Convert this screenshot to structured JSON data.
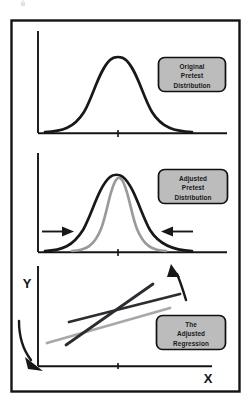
{
  "figure": {
    "background_color": "#ffffff",
    "frame": {
      "name": "outer-border",
      "color": "#141414",
      "x": 11,
      "y": 20,
      "width": 229,
      "height": 372
    },
    "ink_colors": {
      "black": "#17181a",
      "dark_line": "#2b2d31",
      "gray_curve": "#9a9a9a",
      "gray_line": "#a8a8a8",
      "callout_fill": "#bcbcbc",
      "callout_border": "#101010",
      "axis": "#141414"
    }
  },
  "panels": [
    {
      "id": "panel-original",
      "name": "original-pretest-panel",
      "callout": {
        "name": "callout-original-pretest-distribution",
        "lines": [
          "Original",
          "Pretest",
          "Distribution"
        ],
        "fill": "#bcbcbc"
      },
      "axis": {
        "y_axis": true,
        "x_axis": true,
        "center_tick": true
      },
      "curves": [
        {
          "name": "original-distribution-curve",
          "color": "#17181a",
          "width": 2.6,
          "spread": "wide"
        }
      ],
      "arrows": []
    },
    {
      "id": "panel-adjusted",
      "name": "adjusted-pretest-panel",
      "callout": {
        "name": "callout-adjusted-pretest-distribution",
        "lines": [
          "Adjusted",
          "Pretest",
          "Distribution"
        ],
        "fill": "#bcbcbc"
      },
      "axis": {
        "y_axis": true,
        "x_axis": true,
        "center_tick": true
      },
      "curves": [
        {
          "name": "unadjusted-distribution-curve",
          "color": "#17181a",
          "width": 2.6,
          "spread": "wide"
        },
        {
          "name": "adjusted-distribution-curve",
          "color": "#9a9a9a",
          "width": 2.6,
          "spread": "narrow"
        }
      ],
      "arrows": [
        {
          "name": "left-shrink-arrow",
          "direction": "right",
          "color": "#17181a"
        },
        {
          "name": "right-shrink-arrow",
          "direction": "left",
          "color": "#17181a"
        }
      ]
    },
    {
      "id": "panel-regression",
      "name": "adjusted-regression-panel",
      "callout": {
        "name": "callout-the-adjusted-regression",
        "lines": [
          "The",
          "Adjusted",
          "Regression"
        ],
        "fill": "#bcbcbc"
      },
      "axis": {
        "y_axis": true,
        "x_axis": true,
        "center_tick": true,
        "y_label": "Y",
        "x_label": "X"
      },
      "lines": [
        {
          "name": "shallow-regression-line",
          "color": "#2b2d31",
          "width": 2.6,
          "slope": "shallow"
        },
        {
          "name": "steep-regression-line",
          "color": "#2b2d31",
          "width": 2.6,
          "slope": "steep"
        },
        {
          "name": "gray-regression-line",
          "color": "#a8a8a8",
          "width": 2.6,
          "slope": "medium"
        }
      ],
      "arrows": [
        {
          "name": "callout-pointer-arrow",
          "direction": "up-left",
          "color": "#17181a"
        },
        {
          "name": "origin-shift-arrow",
          "direction": "down-right",
          "color": "#17181a"
        }
      ]
    }
  ],
  "artifacts": [
    {
      "name": "scan-speck",
      "x": 22,
      "y": 3
    }
  ]
}
